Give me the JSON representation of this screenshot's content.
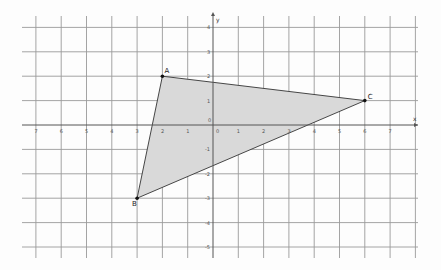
{
  "diagram": {
    "type": "coordinate-plane-triangle",
    "axes": {
      "x_label": "x",
      "y_label": "y",
      "x_range": [
        -7,
        7
      ],
      "y_range": [
        -5,
        4
      ],
      "x_tick_labels_left": [
        "7",
        "6",
        "5",
        "4",
        "3",
        "2",
        "1"
      ],
      "x_tick_labels_right": [
        "1",
        "2",
        "3",
        "4",
        "5",
        "6",
        "7"
      ],
      "origin_label": "0",
      "y_tick_labels_top": [
        "4",
        "3",
        "2",
        "1"
      ],
      "y_tick_labels_bottom": [
        "-1",
        "-2",
        "-3",
        "-4",
        "-5"
      ]
    },
    "points": [
      {
        "name": "A",
        "x": -2,
        "y": 2
      },
      {
        "name": "B",
        "x": -3,
        "y": -3
      },
      {
        "name": "C",
        "x": 6,
        "y": 1
      }
    ],
    "triangle": {
      "vertices": [
        "A",
        "B",
        "C"
      ],
      "fill": "#d9d9d9",
      "stroke": "#333333"
    }
  }
}
